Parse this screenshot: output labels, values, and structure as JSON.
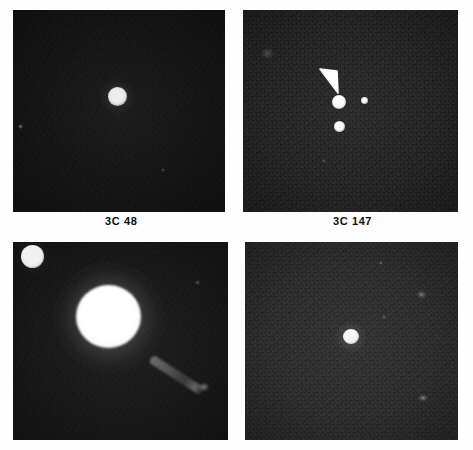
{
  "figure": {
    "background_color": "#ffffff",
    "plate_color": "#0a0a0a",
    "width": 473,
    "height": 450
  },
  "panels": [
    {
      "id": "panel-3c48",
      "label": "3C 48",
      "position": {
        "x": 13,
        "y": 10,
        "w": 212,
        "h": 202
      },
      "background_tone": "#070707",
      "grain": "fine",
      "label_position": {
        "x": 105,
        "y": 215
      },
      "sources": [
        {
          "name": "quasar-core",
          "x": 104,
          "y": 86,
          "d": 19,
          "brightness": "saturated"
        },
        {
          "name": "faint-star-left",
          "x": 7,
          "y": 116,
          "d": 4,
          "brightness": "faint"
        },
        {
          "name": "faint-star-lower",
          "x": 150,
          "y": 160,
          "d": 3,
          "brightness": "faint"
        }
      ],
      "arrow": null,
      "jet": null
    },
    {
      "id": "panel-3c147",
      "label": "3C 147",
      "position": {
        "x": 243,
        "y": 10,
        "w": 215,
        "h": 202
      },
      "background_tone": "#101010",
      "grain": "coarse",
      "label_position": {
        "x": 333,
        "y": 215
      },
      "sources": [
        {
          "name": "quasar-core",
          "x": 96,
          "y": 92,
          "d": 13,
          "brightness": "saturated"
        },
        {
          "name": "companion-below",
          "x": 96,
          "y": 116,
          "d": 10,
          "brightness": "bright"
        },
        {
          "name": "companion-right",
          "x": 121,
          "y": 90,
          "d": 6,
          "brightness": "bright"
        },
        {
          "name": "faint-smudge-upper-left",
          "x": 22,
          "y": 42,
          "d": 7,
          "brightness": "very-faint"
        },
        {
          "name": "faint-star-mid",
          "x": 80,
          "y": 150,
          "d": 3,
          "brightness": "very-faint"
        }
      ],
      "arrow": {
        "tip_x": 98,
        "tip_y": 84,
        "tail_x": 82,
        "tail_y": 64,
        "color": "#ffffff"
      },
      "jet": null
    },
    {
      "id": "panel-3c273",
      "label": "",
      "position": {
        "x": 13,
        "y": 242,
        "w": 215,
        "h": 198
      },
      "background_tone": "#0b0b0b",
      "grain": "fine",
      "label_position": null,
      "sources": [
        {
          "name": "foreground-star",
          "x": 19,
          "y": 14,
          "d": 22,
          "brightness": "saturated"
        },
        {
          "name": "quasar-core",
          "x": 95,
          "y": 74,
          "d": 63,
          "brightness": "overexposed"
        },
        {
          "name": "faint-star-right",
          "x": 184,
          "y": 40,
          "d": 4,
          "brightness": "very-faint"
        }
      ],
      "arrow": null,
      "jet": {
        "x": 148,
        "y": 120,
        "length": 58,
        "angle_deg": 33,
        "thickness": 7,
        "color": "#9a9a9a"
      }
    },
    {
      "id": "panel-unlabeled-lower-right",
      "label": "",
      "position": {
        "x": 245,
        "y": 242,
        "w": 213,
        "h": 198
      },
      "background_tone": "#1a1a1a",
      "grain": "coarse",
      "label_position": null,
      "sources": [
        {
          "name": "quasar-core",
          "x": 105,
          "y": 94,
          "d": 15,
          "brightness": "saturated"
        },
        {
          "name": "faint-galaxy-upper-right",
          "x": 176,
          "y": 52,
          "d": 8,
          "brightness": "faint"
        },
        {
          "name": "faint-object-lower-right",
          "x": 178,
          "y": 156,
          "d": 7,
          "brightness": "faint"
        },
        {
          "name": "faint-star-top",
          "x": 136,
          "y": 21,
          "d": 3,
          "brightness": "very-faint"
        },
        {
          "name": "faint-star-mid-right",
          "x": 139,
          "y": 75,
          "d": 3,
          "brightness": "very-faint"
        }
      ],
      "arrow": null,
      "jet": null
    }
  ]
}
